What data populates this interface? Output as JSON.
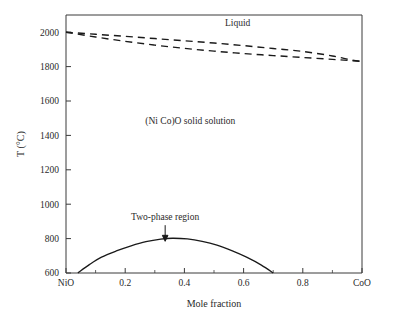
{
  "figure": {
    "background_color": "#ffffff",
    "line_color": "#1a1a1a",
    "axis_color": "#3a3a3a"
  },
  "chart_data": {
    "type": "line",
    "title": "",
    "subtitle": "",
    "xlabel": "Mole fraction",
    "ylabel": "T (°C)",
    "xlim": [
      0,
      1
    ],
    "ylim": [
      600,
      2100
    ],
    "grid": false,
    "legend_position": "none",
    "x_tick_labels": [
      "NiO",
      "0.2",
      "0.4",
      "0.6",
      "0.8",
      "CoO"
    ],
    "x_tick_values": [
      0,
      0.2,
      0.4,
      0.6,
      0.8,
      1.0
    ],
    "x_minor_tick_values": [
      0.1,
      0.3,
      0.5,
      0.7,
      0.9
    ],
    "y_tick_labels": [
      "600",
      "800",
      "1000",
      "1200",
      "1400",
      "1600",
      "1800",
      "2000"
    ],
    "y_tick_values": [
      600,
      800,
      1000,
      1200,
      1400,
      1600,
      1800,
      2000
    ],
    "series": [
      {
        "name": "liquidus",
        "style": "dashed",
        "x": [
          0.0,
          0.1,
          0.2,
          0.3,
          0.4,
          0.5,
          0.6,
          0.7,
          0.8,
          0.9,
          0.96,
          1.0
        ],
        "values": [
          2000,
          1988,
          1976,
          1963,
          1950,
          1937,
          1922,
          1905,
          1888,
          1862,
          1840,
          1830
        ]
      },
      {
        "name": "solidus",
        "style": "dashed",
        "x": [
          0.0,
          0.1,
          0.2,
          0.3,
          0.4,
          0.5,
          0.6,
          0.7,
          0.8,
          0.9,
          0.96,
          1.0
        ],
        "values": [
          2000,
          1972,
          1947,
          1925,
          1906,
          1890,
          1876,
          1864,
          1853,
          1842,
          1835,
          1830
        ]
      },
      {
        "name": "miscibility-gap",
        "style": "solid",
        "x": [
          0.04,
          0.08,
          0.12,
          0.17,
          0.22,
          0.27,
          0.32,
          0.36,
          0.41,
          0.46,
          0.51,
          0.56,
          0.61,
          0.66,
          0.7
        ],
        "values": [
          600,
          650,
          692,
          728,
          758,
          782,
          797,
          802,
          798,
          784,
          762,
          730,
          692,
          646,
          600
        ]
      }
    ],
    "annotations": [
      {
        "name": "liquid-label",
        "text": "Liquid",
        "x": 0.58,
        "y": 2035,
        "arrow": false
      },
      {
        "name": "solid-solution-label",
        "text": "(Ni Co)O solid solution",
        "x": 0.42,
        "y": 1468,
        "arrow": false
      },
      {
        "name": "two-phase-label",
        "text": "Two-phase region",
        "x": 0.335,
        "y": 906,
        "arrow": true,
        "arrow_from_y": 878,
        "arrow_to_y": 790
      }
    ]
  }
}
